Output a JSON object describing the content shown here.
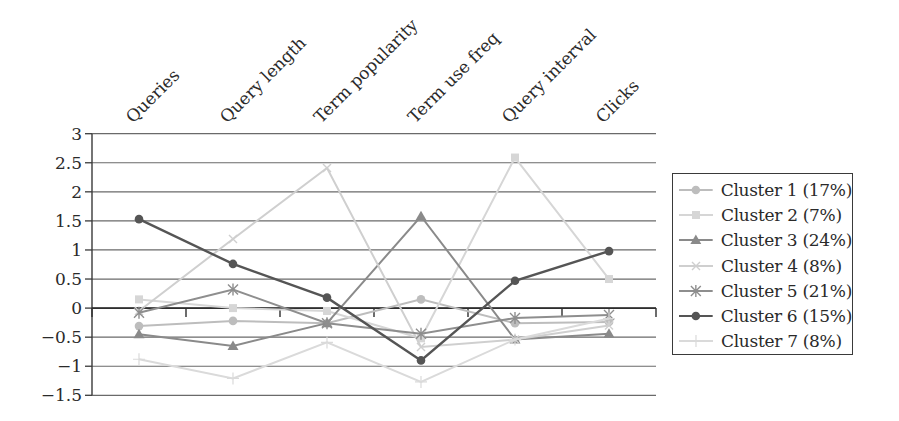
{
  "chart_data": {
    "type": "line",
    "title": "",
    "xlabel": "",
    "ylabel": "",
    "categories": [
      "Queries",
      "Query length",
      "Term popularity",
      "Term use freq",
      "Query interval",
      "Clicks"
    ],
    "ylim": [
      -1.5,
      3
    ],
    "yticks": [
      3,
      2.5,
      2,
      1.5,
      1,
      0.5,
      0,
      -0.5,
      -1,
      -1.5
    ],
    "ytick_labels": [
      "3",
      "2.5",
      "2",
      "1.5",
      "1",
      "0.5",
      "0",
      "−0.5",
      "−1",
      "−1.5"
    ],
    "grid": true,
    "legend_position": "right",
    "series": [
      {
        "name": "Cluster 1 (17%)",
        "marker": "circle",
        "color": "#bdbdbd",
        "values": [
          -0.31,
          -0.22,
          -0.26,
          0.15,
          -0.26,
          -0.24
        ]
      },
      {
        "name": "Cluster 2 (7%)",
        "marker": "square",
        "color": "#d6d6d6",
        "values": [
          0.15,
          0.0,
          -0.05,
          -0.52,
          2.59,
          0.5
        ]
      },
      {
        "name": "Cluster 3 (24%)",
        "marker": "triangle",
        "color": "#8a8a8a",
        "values": [
          -0.45,
          -0.65,
          -0.26,
          1.58,
          -0.54,
          -0.44
        ]
      },
      {
        "name": "Cluster 4 (8%)",
        "marker": "x",
        "color": "#cfcfcf",
        "values": [
          -0.05,
          1.19,
          2.41,
          -0.67,
          -0.54,
          -0.3
        ]
      },
      {
        "name": "Cluster 5 (21%)",
        "marker": "star",
        "color": "#8e8e8e",
        "values": [
          -0.08,
          0.32,
          -0.26,
          -0.44,
          -0.17,
          -0.12
        ]
      },
      {
        "name": "Cluster 6 (15%)",
        "marker": "circle",
        "color": "#555555",
        "values": [
          1.53,
          0.76,
          0.18,
          -0.9,
          0.47,
          0.98
        ]
      },
      {
        "name": "Cluster 7 (8%)",
        "marker": "plus",
        "color": "#dadada",
        "values": [
          -0.88,
          -1.21,
          -0.59,
          -1.27,
          -0.54,
          -0.18
        ]
      }
    ]
  },
  "legend": {
    "items": [
      {
        "label": "Cluster 1 (17%)"
      },
      {
        "label": "Cluster 2 (7%)"
      },
      {
        "label": "Cluster 3 (24%)"
      },
      {
        "label": "Cluster 4 (8%)"
      },
      {
        "label": "Cluster 5 (21%)"
      },
      {
        "label": "Cluster 6 (15%)"
      },
      {
        "label": "Cluster 7 (8%)"
      }
    ]
  }
}
